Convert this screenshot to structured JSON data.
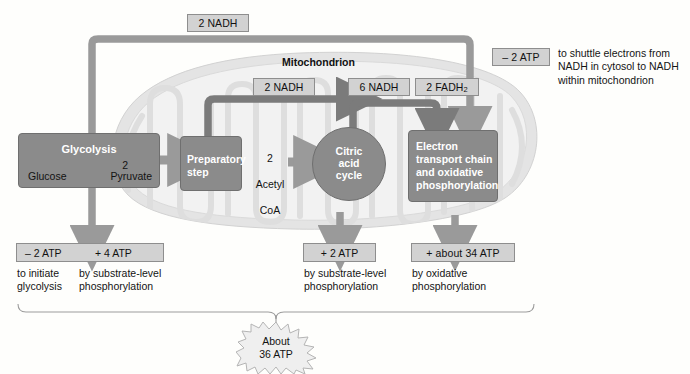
{
  "diagram": {
    "organelle_label": "Mitochondrion",
    "colors": {
      "process_box": "#8b8b8b",
      "tag_box": "#d2d2d2",
      "arrow_light": "#9a9a9a",
      "arrow_dark": "#7b7b7b",
      "mitochondrion": "#dcdcdc",
      "text": "#111111"
    }
  },
  "processes": {
    "glycolysis": {
      "title": "Glycolysis",
      "input": "Glucose",
      "output_count": "2",
      "output": "Pyruvate"
    },
    "preparatory_step": {
      "title": "Preparatory\nstep"
    },
    "acetyl": {
      "count": "2",
      "line2": "Acetyl",
      "line3": "CoA"
    },
    "citric_acid_cycle": {
      "title": "Citric\nacid\ncycle"
    },
    "electron_transport": {
      "title": "Electron\ntransport chain\nand oxidative\nphosphorylation"
    }
  },
  "carriers": {
    "glycolysis_nadh": "2 NADH",
    "prep_nadh": "2 NADH",
    "citric_nadh": "6 NADH",
    "citric_fadh2_pre": "2 FADH",
    "citric_fadh2_sub": "2"
  },
  "atp": {
    "shuttle": {
      "value": "– 2 ATP",
      "caption": "to shuttle electrons from\nNADH in cytosol to NADH\nwithin mitochondrion"
    },
    "glycolysis_cost": {
      "value": "– 2 ATP",
      "caption": "to initiate\nglycolysis"
    },
    "glycolysis_gain": {
      "value": "+ 4 ATP",
      "caption": "by substrate-level\nphosphorylation"
    },
    "citric_gain": {
      "value": "+ 2 ATP",
      "caption": "by substrate-level\nphosphorylation"
    },
    "etc_gain": {
      "value": "+ about 34 ATP",
      "caption": "by oxidative\nphosphorylation"
    }
  },
  "total": {
    "line1": "About",
    "line2": "36 ATP",
    "text": "About\n36 ATP"
  }
}
